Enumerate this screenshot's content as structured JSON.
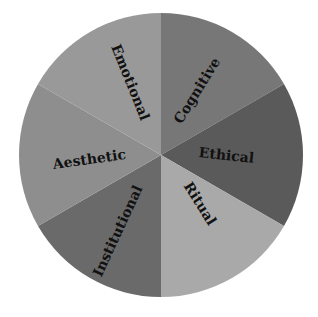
{
  "chart_data": {
    "type": "pie",
    "title": "",
    "categories": [
      "Cognitive",
      "Ethical",
      "Ritual",
      "Institutional",
      "Aesthetic",
      "Emotional"
    ],
    "values": [
      1,
      1,
      1,
      1,
      1,
      1
    ],
    "colors": [
      "#777777",
      "#5a5a5a",
      "#a9a9a9",
      "#6a6a6a",
      "#8e8e8e",
      "#999999"
    ],
    "legend": "none",
    "labels_inside": true
  },
  "slices": [
    {
      "label": "Cognitive",
      "color": "#777777"
    },
    {
      "label": "Ethical",
      "color": "#5a5a5a"
    },
    {
      "label": "Ritual",
      "color": "#a9a9a9"
    },
    {
      "label": "Institutional",
      "color": "#6a6a6a"
    },
    {
      "label": "Aesthetic",
      "color": "#8e8e8e"
    },
    {
      "label": "Emotional",
      "color": "#999999"
    }
  ]
}
